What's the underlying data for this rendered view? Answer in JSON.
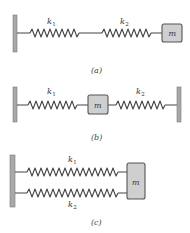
{
  "figure": {
    "panels": [
      {
        "id": "a",
        "caption": "(a)",
        "configuration": "series",
        "springs": [
          {
            "symbol": "k",
            "subscript": "1"
          },
          {
            "symbol": "k",
            "subscript": "2"
          }
        ],
        "mass_label": "m"
      },
      {
        "id": "b",
        "caption": "(b)",
        "configuration": "mass-between-springs",
        "springs": [
          {
            "symbol": "k",
            "subscript": "1"
          },
          {
            "symbol": "k",
            "subscript": "2"
          }
        ],
        "mass_label": "m"
      },
      {
        "id": "c",
        "caption": "(c)",
        "configuration": "parallel",
        "springs": [
          {
            "symbol": "k",
            "subscript": "1"
          },
          {
            "symbol": "k",
            "subscript": "2"
          }
        ],
        "mass_label": "m"
      }
    ],
    "colors": {
      "wall": "#a8a8a8",
      "mass_fill": "#cfcfcf",
      "stroke": "#444444"
    }
  }
}
